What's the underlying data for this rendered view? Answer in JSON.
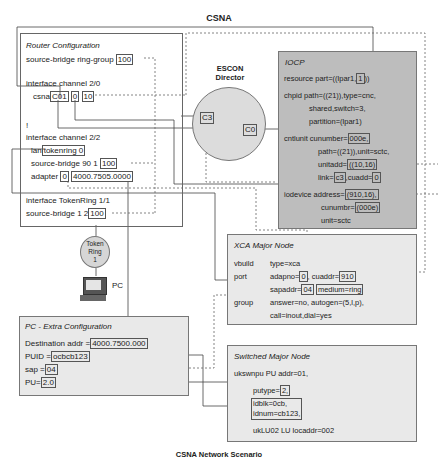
{
  "title": "CSNA",
  "caption": "CSNA Network Scenario",
  "router": {
    "heading": "Router Configuration",
    "ring_group_label": "source-bridge ring-group",
    "ring_group_value": "100",
    "iface_20": "interface channel 2/0",
    "csna_label": "csna",
    "csna_vals": [
      "C01",
      "0",
      "10"
    ],
    "bang": "!",
    "iface_22": "interface channel 2/2",
    "lan_label": "lan",
    "lan_value": "tokenring 0",
    "sb_label": "source-bridge  90  1",
    "sb_value": "100",
    "adapter_label": "adapter",
    "adapter_vals": [
      "0",
      "4000.7505.0000"
    ],
    "iface_tr": "interface TokenRing 1/1",
    "sb2_label": "source-bridge 1 2",
    "sb2_value": "100"
  },
  "escon": {
    "line1": "ESCON",
    "line2": "Director",
    "port_c3": "C3",
    "port_c0": "C0"
  },
  "token_ring": {
    "line1": "Token",
    "line2": "Ring",
    "line3": "1"
  },
  "pc_label": "PC",
  "iocp": {
    "heading": "IOCP",
    "resource": "resource part=((lpar1,",
    "resource_val": "1",
    "resource_end": "))",
    "chpid1": "chpid  path=((21)),type=cnc,",
    "chpid2": "shared,switch=3,",
    "chpid3": "partition=(lpar1)",
    "cntl1": "cntlunit cunumber=",
    "cntl1_val": "000e,",
    "cntl2": "path=((21)),unit=sctc,",
    "cntl3": "unitadd=",
    "cntl3_val": "((10,16)",
    "cntl4a": "link=",
    "cntl4_val": "c3",
    "cntl4b": ",cuadd=",
    "cntl4_val2": "0",
    "iod1": "iodevice  address=",
    "iod1_val": "(910,16),",
    "iod2": "cunumbr=",
    "iod2_val": "(000e)",
    "iod3": "unit=sctc"
  },
  "xca": {
    "heading": "XCA Major Node",
    "vbuild": "vbuild",
    "vbuild_v": "type=xca",
    "port": "port",
    "adapno": "adapno=",
    "adapno_v": "0",
    "cuaddr": ", cuaddr=",
    "cuaddr_v": "910",
    "sapaddr": "sapaddr=",
    "sapaddr_v": "04",
    "medium": "medium=ring",
    "group": "group",
    "group1": "answer=no, autogen=(5,l,p),",
    "group2": "call=inout,dial=yes"
  },
  "pc_cfg": {
    "heading": "PC - Extra Configuration",
    "dest": "Destination addr =",
    "dest_v": "4000.7500.000",
    "puid": "PUID =",
    "puid_v": "ocbcb123",
    "sap": "sap =",
    "sap_v": "04",
    "pu": "PU=",
    "pu_v": "2.0"
  },
  "smn": {
    "heading": "Switched Major Node",
    "l1": "ukswnpu  PU addr=01,",
    "putype": "putype=",
    "putype_v": "2,",
    "idblk": "idblk=0cb,",
    "idnum": "idnum=cb123,",
    "lu": "ukLU02  LU  locaddr=002"
  }
}
